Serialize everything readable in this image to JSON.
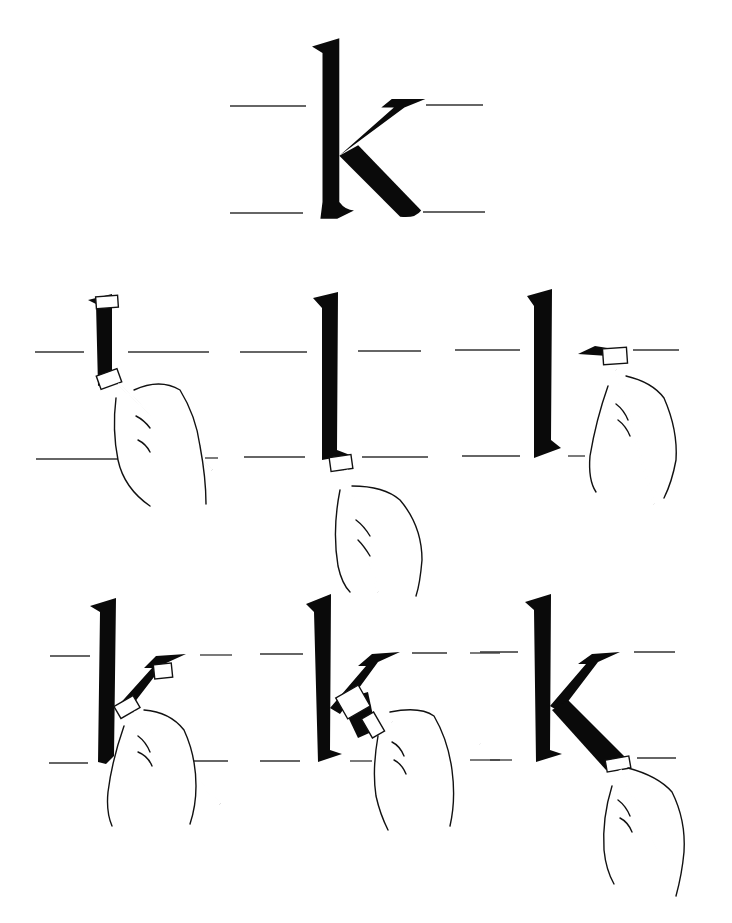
{
  "title": {
    "letter": "k",
    "description": "Calligraphy stroke-order diagram for lowercase k"
  },
  "colors": {
    "ink": "#0a0a0a",
    "paper": "#ffffff",
    "guide": "#333333"
  },
  "guidelines": {
    "x_height_label": "x-height",
    "baseline_label": "baseline"
  },
  "steps": [
    {
      "id": 1,
      "caption": "Stroke 1: begin ascender with pen at top serif",
      "stage": "ascender-start"
    },
    {
      "id": 2,
      "caption": "Stroke 1: pull ascender down to baseline",
      "stage": "ascender-end"
    },
    {
      "id": 3,
      "caption": "Stroke 2: place pen for arm at x-height",
      "stage": "arm-start"
    },
    {
      "id": 4,
      "caption": "Stroke 2: pull arm diagonally to stem",
      "stage": "arm-end"
    },
    {
      "id": 5,
      "caption": "Stroke 3: begin leg from junction",
      "stage": "leg-start"
    },
    {
      "id": 6,
      "caption": "Stroke 3: complete leg to baseline",
      "stage": "leg-end"
    }
  ]
}
